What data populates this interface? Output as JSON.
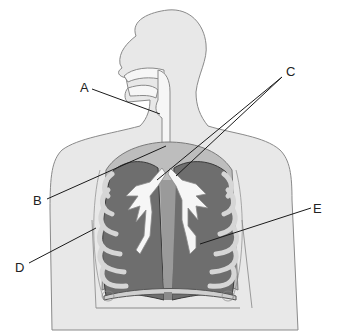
{
  "diagram": {
    "labels": [
      {
        "id": "A",
        "text": "A",
        "x": 80,
        "y": 91,
        "line": [
          [
            92,
            89
          ],
          [
            160,
            114
          ]
        ]
      },
      {
        "id": "B",
        "text": "B",
        "x": 33,
        "y": 204,
        "line": [
          [
            47,
            199
          ],
          [
            166,
            146
          ]
        ]
      },
      {
        "id": "C",
        "text": "C",
        "x": 288,
        "y": 75,
        "line": [
          [
            282,
            77
          ],
          [
            157,
            180
          ]
        ],
        "line2": [
          [
            282,
            77
          ],
          [
            176,
            176
          ]
        ]
      },
      {
        "id": "D",
        "text": "D",
        "x": 15,
        "y": 270,
        "line": [
          [
            29,
            263
          ],
          [
            96,
            228
          ]
        ]
      },
      {
        "id": "E",
        "text": "E",
        "x": 313,
        "y": 212,
        "line": [
          [
            311,
            208
          ],
          [
            200,
            244
          ]
        ]
      }
    ],
    "colors": {
      "background": "#ffffff",
      "body_fill": "#e8e8e8",
      "body_outline": "#8a8a8a",
      "airway_fill": "#f6f6f6",
      "lung_fill": "#6e6e6e",
      "lung_outline": "#3a3a3a",
      "rib_fill": "#d6d6d6",
      "label_line": "#1a1a1a",
      "label_text": "#222222"
    }
  }
}
